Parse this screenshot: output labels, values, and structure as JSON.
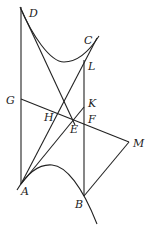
{
  "diagram": {
    "type": "geometry-figure",
    "labels": {
      "D": "D",
      "C": "C",
      "L": "L",
      "G": "G",
      "K": "K",
      "H": "H",
      "E": "E",
      "F": "F",
      "M": "M",
      "A": "A",
      "B": "B"
    },
    "points": {
      "D": [
        20,
        7
      ],
      "C": [
        99,
        36
      ],
      "L": [
        84,
        60
      ],
      "G": [
        21,
        99
      ],
      "K": [
        84,
        100
      ],
      "H": [
        57,
        117
      ],
      "E": [
        73,
        121
      ],
      "F": [
        84,
        123
      ],
      "M": [
        129,
        142
      ],
      "A": [
        21,
        184
      ],
      "B": [
        84,
        196
      ]
    },
    "stroke_color": "#222222"
  }
}
